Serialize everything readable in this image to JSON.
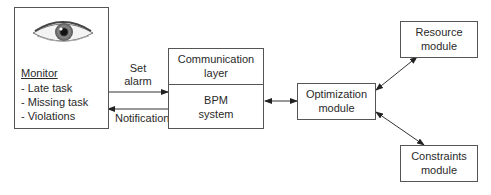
{
  "monitor": {
    "title": "Monitor",
    "items": [
      "- Late task",
      "- Missing task",
      "- Violations"
    ],
    "icon": "eye-icon"
  },
  "edges": {
    "set_alarm_line1": "Set",
    "set_alarm_line2": "alarm",
    "notification": "Notification"
  },
  "bpm_block": {
    "top_line1": "Communication",
    "top_line2": "layer",
    "bottom_line1": "BPM",
    "bottom_line2": "system"
  },
  "optimization": {
    "line1": "Optimization",
    "line2": "module"
  },
  "resource": {
    "line1": "Resource",
    "line2": "module"
  },
  "constraints": {
    "line1": "Constraints",
    "line2": "module"
  },
  "colors": {
    "line": "#333333",
    "border": "#555555",
    "background": "#ffffff"
  }
}
